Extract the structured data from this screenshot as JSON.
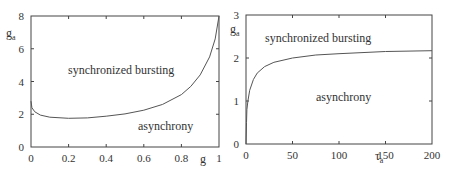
{
  "chart_data": [
    {
      "type": "line",
      "title": "",
      "xlabel": "g",
      "ylabel": "g_a",
      "xlim": [
        0,
        1
      ],
      "ylim": [
        0,
        8
      ],
      "xticks": [
        "0",
        "0.2",
        "0.4",
        "0.6",
        "0.8",
        "1"
      ],
      "yticks": [
        "0",
        "2",
        "4",
        "6",
        "8"
      ],
      "grid": false,
      "annotations": [
        "synchronized bursting",
        "asynchrony"
      ],
      "series": [
        {
          "name": "boundary",
          "x": [
            0,
            0.005,
            0.02,
            0.05,
            0.1,
            0.2,
            0.3,
            0.4,
            0.5,
            0.6,
            0.7,
            0.8,
            0.85,
            0.9,
            0.95,
            0.98,
            1.0
          ],
          "y": [
            2.8,
            2.4,
            2.15,
            1.95,
            1.82,
            1.75,
            1.78,
            1.88,
            2.02,
            2.25,
            2.6,
            3.2,
            3.7,
            4.4,
            5.5,
            6.6,
            8.0
          ]
        }
      ]
    },
    {
      "type": "line",
      "title": "",
      "xlabel": "τ_a",
      "ylabel": "g_a",
      "xlim": [
        0,
        200
      ],
      "ylim": [
        0,
        3
      ],
      "xticks": [
        "0",
        "50",
        "100",
        "150",
        "200"
      ],
      "yticks": [
        "0",
        "1",
        "2",
        "3"
      ],
      "grid": false,
      "annotations": [
        "synchronized bursting",
        "asynchrony"
      ],
      "series": [
        {
          "name": "boundary",
          "x": [
            0,
            0.5,
            1,
            2,
            4,
            8,
            12,
            20,
            30,
            50,
            75,
            100,
            150,
            200
          ],
          "y": [
            0.0,
            0.5,
            0.8,
            1.0,
            1.25,
            1.5,
            1.65,
            1.8,
            1.9,
            2.0,
            2.07,
            2.1,
            2.15,
            2.17
          ]
        }
      ]
    }
  ],
  "left_panel": {
    "xlabel": "g",
    "ylabel_main": "g",
    "ylabel_sub": "a",
    "region_upper": "synchronized bursting",
    "region_lower": "asynchrony"
  },
  "right_panel": {
    "xlabel_main": "τ",
    "xlabel_sub": "a",
    "ylabel_main": "g",
    "ylabel_sub": "a",
    "region_upper": "synchronized bursting",
    "region_lower": "asynchrony"
  }
}
